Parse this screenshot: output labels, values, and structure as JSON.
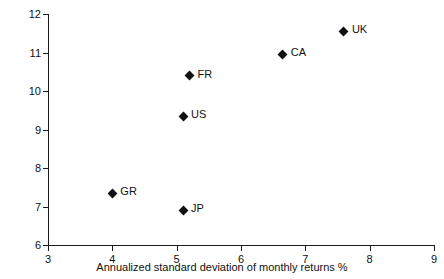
{
  "chart_data": {
    "type": "scatter",
    "title": "",
    "xlabel": "Annualized standard deviation of monthly returns %",
    "ylabel": "Annual return %",
    "xlim": [
      3,
      9
    ],
    "ylim": [
      6,
      12
    ],
    "xticks": [
      "3",
      "4",
      "5",
      "6",
      "7",
      "8",
      "9"
    ],
    "yticks": [
      "6",
      "7",
      "8",
      "9",
      "10",
      "11",
      "12"
    ],
    "grid": false,
    "legend": "none",
    "marker": "filled-diamond",
    "marker_color": "#111111",
    "points": [
      {
        "label": "GR",
        "x": 4.0,
        "y": 7.35
      },
      {
        "label": "JP",
        "x": 5.1,
        "y": 6.9
      },
      {
        "label": "US",
        "x": 5.1,
        "y": 9.35
      },
      {
        "label": "FR",
        "x": 5.2,
        "y": 10.4
      },
      {
        "label": "CA",
        "x": 6.65,
        "y": 10.95
      },
      {
        "label": "UK",
        "x": 7.6,
        "y": 11.55
      }
    ]
  }
}
